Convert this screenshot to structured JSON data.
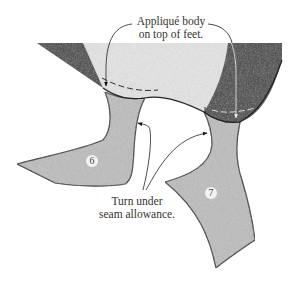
{
  "diagram": {
    "callouts": {
      "top": {
        "line1": "Appliqué body",
        "line2": "on top of feet."
      },
      "bottom": {
        "line1": "Turn under",
        "line2": "seam allowance."
      }
    },
    "pieces": [
      {
        "id": "left-foot",
        "number": "6"
      },
      {
        "id": "right-foot",
        "number": "7"
      }
    ],
    "colors": {
      "body_light": "#e6e6e6",
      "body_dark": "#3a3a3a",
      "foot": "#bdbdbd",
      "outline": "#222222",
      "background": "#ffffff"
    }
  }
}
